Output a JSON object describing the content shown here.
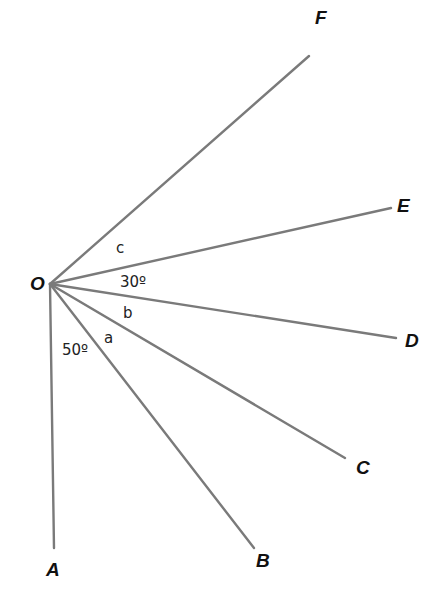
{
  "diagram": {
    "origin": {
      "label": "O",
      "x": 50,
      "y": 284
    },
    "rays": [
      {
        "id": "OA",
        "end_label": "A",
        "x2": 54,
        "y2": 548
      },
      {
        "id": "OB",
        "end_label": "B",
        "x2": 254,
        "y2": 548
      },
      {
        "id": "OC",
        "end_label": "C",
        "x2": 345,
        "y2": 458
      },
      {
        "id": "OD",
        "end_label": "D",
        "x2": 396,
        "y2": 338
      },
      {
        "id": "OE",
        "end_label": "E",
        "x2": 391,
        "y2": 208
      },
      {
        "id": "OF",
        "end_label": "F",
        "x2": 309,
        "y2": 56
      }
    ],
    "point_labels": {
      "O": "O",
      "A": "A",
      "B": "B",
      "C": "C",
      "D": "D",
      "E": "E",
      "F": "F"
    },
    "angle_labels": {
      "angle_AOB": "50º",
      "angle_BOC": "a",
      "angle_COD": "b",
      "angle_DOE": "30º",
      "angle_EOF": "c"
    },
    "line_color": "#7a7a7a"
  }
}
